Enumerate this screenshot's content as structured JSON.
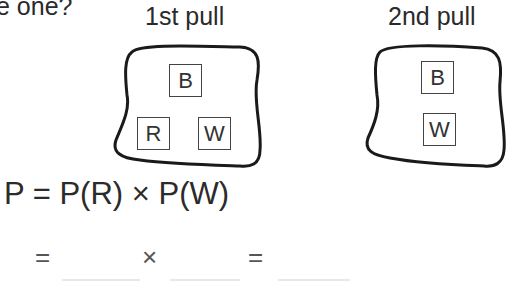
{
  "question": {
    "text_fragment": "e one?"
  },
  "bags": [
    {
      "label": "1st pull",
      "items": [
        "B",
        "R",
        "W"
      ]
    },
    {
      "label": "2nd pull",
      "items": [
        "B",
        "W"
      ]
    }
  ],
  "equation": {
    "main": "P = P(R) × P(W)",
    "second_line": {
      "equals_1": "=",
      "times": "×",
      "equals_2": "="
    }
  }
}
